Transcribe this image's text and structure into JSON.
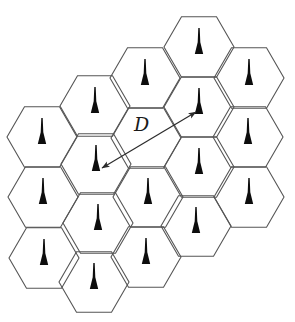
{
  "figure": {
    "type": "hexagonal-cell-grid-diagram",
    "background": "#ffffff",
    "hex_grid": {
      "radius": 35,
      "stroke_color": "#565656",
      "stroke_width": 1.1,
      "cells": [
        {
          "id": "c0r0",
          "x": 42,
          "y": 137,
          "antenna": true
        },
        {
          "id": "c0r1",
          "x": 43,
          "y": 197,
          "antenna": true
        },
        {
          "id": "c0r2",
          "x": 44,
          "y": 258,
          "antenna": true
        },
        {
          "id": "c1r0",
          "x": 95,
          "y": 106,
          "antenna": true
        },
        {
          "id": "c1r1",
          "x": 96,
          "y": 164,
          "antenna": true
        },
        {
          "id": "c1r2",
          "x": 98,
          "y": 223,
          "antenna": true
        },
        {
          "id": "c1r3",
          "x": 94,
          "y": 282,
          "antenna": true
        },
        {
          "id": "c2r0",
          "x": 145,
          "y": 78,
          "antenna": true
        },
        {
          "id": "c2r1",
          "x": 146,
          "y": 138,
          "antenna": false
        },
        {
          "id": "c2r2",
          "x": 148,
          "y": 197,
          "antenna": true
        },
        {
          "id": "c2r3",
          "x": 146,
          "y": 257,
          "antenna": true
        },
        {
          "id": "c3r0",
          "x": 199,
          "y": 47,
          "antenna": true
        },
        {
          "id": "c3r1",
          "x": 199,
          "y": 107,
          "antenna": true
        },
        {
          "id": "c3r2",
          "x": 199,
          "y": 167,
          "antenna": true
        },
        {
          "id": "c3r3",
          "x": 196,
          "y": 226,
          "antenna": true
        },
        {
          "id": "c4r0",
          "x": 249,
          "y": 78,
          "antenna": true
        },
        {
          "id": "c4r1",
          "x": 248,
          "y": 137,
          "antenna": true
        },
        {
          "id": "c4r2",
          "x": 249,
          "y": 197,
          "antenna": true
        }
      ]
    },
    "antenna_icon": {
      "name": "antenna-mast-icon",
      "color": "#0d0d0d",
      "height": 26,
      "base_half_width": 4.2,
      "stem_half_width": 0.7,
      "base_offset_y": 7
    },
    "distance_arrow": {
      "from_cell": "c1r1",
      "to_cell": "c3r1",
      "x1": 102,
      "y1": 168,
      "x2": 196,
      "y2": 112,
      "double_headed": true,
      "color": "#2b2b2b",
      "stroke_width": 1.2,
      "label": "D",
      "label_x": 134,
      "label_y": 131,
      "label_font_size": 19,
      "label_color": "#1a1a1a"
    }
  }
}
